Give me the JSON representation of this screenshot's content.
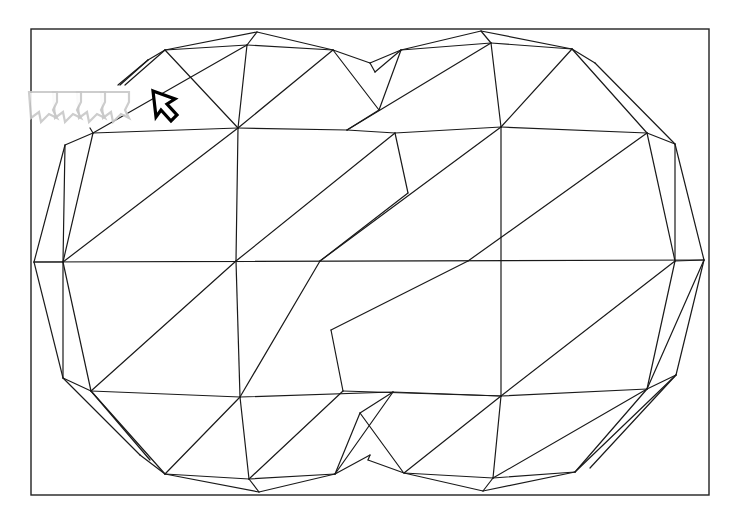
{
  "canvas": {
    "width": 736,
    "height": 516,
    "background": "#ffffff",
    "stroke_color": "#1a1a1a"
  },
  "frame": {
    "x": 31,
    "y": 29,
    "width": 678,
    "height": 466
  },
  "mesh": {
    "description": "Two overlapping triangulated polygon blobs (wireframe)",
    "edges": [
      [
        165,
        50,
        257,
        32
      ],
      [
        257,
        32,
        333,
        50
      ],
      [
        165,
        50,
        247,
        45
      ],
      [
        247,
        45,
        333,
        50
      ],
      [
        247,
        45,
        257,
        32
      ],
      [
        165,
        50,
        148,
        60
      ],
      [
        148,
        60,
        120,
        85
      ],
      [
        165,
        50,
        125,
        85
      ],
      [
        148,
        60,
        118,
        85
      ],
      [
        93,
        133,
        65,
        145
      ],
      [
        65,
        145,
        34,
        262
      ],
      [
        65,
        145,
        63,
        262
      ],
      [
        93,
        133,
        63,
        262
      ],
      [
        93,
        133,
        238,
        128
      ],
      [
        93,
        133,
        90,
        128
      ],
      [
        63,
        262,
        34,
        262
      ],
      [
        165,
        50,
        238,
        128
      ],
      [
        247,
        45,
        238,
        128
      ],
      [
        247,
        45,
        93,
        133
      ],
      [
        333,
        50,
        238,
        128
      ],
      [
        333,
        50,
        379,
        110
      ],
      [
        379,
        110,
        347,
        130
      ],
      [
        238,
        128,
        347,
        130
      ],
      [
        347,
        130,
        395,
        133
      ],
      [
        238,
        128,
        63,
        262
      ],
      [
        238,
        128,
        236,
        261
      ],
      [
        395,
        133,
        236,
        261
      ],
      [
        395,
        133,
        408,
        193
      ],
      [
        408,
        193,
        320,
        261
      ],
      [
        34,
        262,
        704,
        260
      ],
      [
        63,
        262,
        91,
        391
      ],
      [
        34,
        262,
        63,
        378
      ],
      [
        63,
        378,
        91,
        391
      ],
      [
        63,
        262,
        63,
        378
      ],
      [
        236,
        261,
        91,
        391
      ],
      [
        236,
        261,
        240,
        397
      ],
      [
        320,
        261,
        240,
        397
      ],
      [
        331,
        330,
        343,
        391
      ],
      [
        331,
        330,
        468,
        261
      ],
      [
        91,
        391,
        240,
        397
      ],
      [
        240,
        397,
        393,
        392
      ],
      [
        343,
        391,
        501,
        396
      ],
      [
        393,
        392,
        501,
        396
      ],
      [
        63,
        378,
        140,
        455
      ],
      [
        140,
        455,
        165,
        474
      ],
      [
        91,
        391,
        165,
        474
      ],
      [
        91,
        391,
        150,
        460
      ],
      [
        240,
        397,
        165,
        474
      ],
      [
        240,
        397,
        249,
        479
      ],
      [
        165,
        474,
        249,
        479
      ],
      [
        165,
        474,
        259,
        492
      ],
      [
        249,
        479,
        259,
        492
      ],
      [
        249,
        479,
        343,
        391
      ],
      [
        249,
        479,
        335,
        474
      ],
      [
        259,
        492,
        335,
        474
      ],
      [
        335,
        474,
        360,
        413
      ],
      [
        335,
        474,
        370,
        455
      ],
      [
        335,
        474,
        393,
        392
      ],
      [
        360,
        413,
        403,
        472
      ],
      [
        360,
        413,
        393,
        392
      ],
      [
        370,
        455,
        368,
        460
      ],
      [
        368,
        460,
        404,
        473
      ],
      [
        333,
        50,
        370,
        63
      ],
      [
        370,
        63,
        401,
        50
      ],
      [
        370,
        63,
        375,
        72
      ],
      [
        375,
        72,
        401,
        50
      ],
      [
        379,
        110,
        401,
        50
      ],
      [
        401,
        50,
        481,
        31
      ],
      [
        481,
        31,
        572,
        49
      ],
      [
        401,
        50,
        491,
        43
      ],
      [
        491,
        43,
        572,
        49
      ],
      [
        491,
        43,
        481,
        31
      ],
      [
        491,
        43,
        347,
        130
      ],
      [
        491,
        43,
        501,
        127
      ],
      [
        572,
        49,
        501,
        127
      ],
      [
        572,
        49,
        595,
        63
      ],
      [
        595,
        63,
        675,
        144
      ],
      [
        572,
        49,
        647,
        133
      ],
      [
        647,
        133,
        675,
        144
      ],
      [
        501,
        127,
        647,
        133
      ],
      [
        395,
        133,
        501,
        127
      ],
      [
        501,
        127,
        320,
        261
      ],
      [
        501,
        127,
        501,
        396
      ],
      [
        647,
        133,
        468,
        261
      ],
      [
        647,
        133,
        675,
        261
      ],
      [
        675,
        144,
        675,
        261
      ],
      [
        675,
        144,
        704,
        260
      ],
      [
        675,
        261,
        704,
        260
      ],
      [
        675,
        261,
        501,
        396
      ],
      [
        675,
        261,
        647,
        389
      ],
      [
        704,
        260,
        676,
        375
      ],
      [
        704,
        260,
        647,
        389
      ],
      [
        647,
        389,
        676,
        375
      ],
      [
        501,
        396,
        647,
        389
      ],
      [
        501,
        396,
        404,
        473
      ],
      [
        501,
        396,
        493,
        478
      ],
      [
        647,
        389,
        493,
        478
      ],
      [
        647,
        389,
        575,
        472
      ],
      [
        676,
        375,
        575,
        472
      ],
      [
        676,
        375,
        590,
        468
      ],
      [
        404,
        473,
        493,
        478
      ],
      [
        404,
        473,
        483,
        491
      ],
      [
        493,
        478,
        483,
        491
      ],
      [
        483,
        491,
        575,
        472
      ],
      [
        493,
        478,
        575,
        472
      ]
    ]
  },
  "cursor": {
    "icon": "arrow-pointer-icon",
    "x": 153,
    "y": 91,
    "trail_count": 4,
    "trail_color": "#c8c8c8",
    "color": "#000000"
  }
}
